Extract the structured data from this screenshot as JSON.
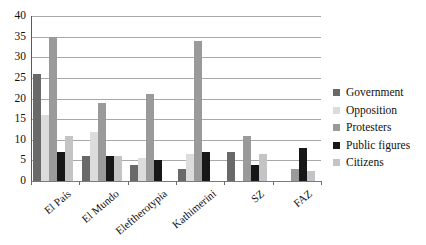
{
  "chart_data": {
    "type": "bar",
    "title": "",
    "xlabel": "",
    "ylabel": "",
    "ylim": [
      0,
      40
    ],
    "yticks": [
      0,
      5,
      10,
      15,
      20,
      25,
      30,
      35,
      40
    ],
    "grid": true,
    "legend_position": "right",
    "categories": [
      "El País",
      "El Mundo",
      "Eleftherotypia",
      "Kathimerini",
      "SZ",
      "FAZ"
    ],
    "series": [
      {
        "name": "Government",
        "color": "#696969",
        "values": [
          26,
          6,
          4,
          3,
          7,
          0
        ]
      },
      {
        "name": "Opposition",
        "color": "#dcdcdc",
        "values": [
          16,
          12,
          5.5,
          6.5,
          0,
          0
        ]
      },
      {
        "name": "Protesters",
        "color": "#9a9a9a",
        "values": [
          35,
          19,
          21,
          34,
          11,
          3
        ]
      },
      {
        "name": "Public figures",
        "color": "#171717",
        "values": [
          7,
          6,
          5,
          7,
          4,
          8
        ]
      },
      {
        "name": "Citizens",
        "color": "#c4c4c4",
        "values": [
          11,
          6,
          0,
          0,
          6.5,
          2.5
        ]
      }
    ]
  },
  "legend": {
    "items": [
      {
        "label": "Government",
        "swatch": "#696969"
      },
      {
        "label": "Opposition",
        "swatch": "#dcdcdc"
      },
      {
        "label": "Protesters",
        "swatch": "#9a9a9a"
      },
      {
        "label": "Public figures",
        "swatch": "#171717"
      },
      {
        "label": "Citizens",
        "swatch": "#c4c4c4"
      }
    ]
  },
  "axes": {
    "y_tick_labels": [
      "0",
      "5",
      "10",
      "15",
      "20",
      "25",
      "30",
      "35",
      "40"
    ],
    "x_tick_labels": [
      "El País",
      "El Mundo",
      "Eleftherotypia",
      "Kathimerini",
      "SZ",
      "FAZ"
    ]
  }
}
